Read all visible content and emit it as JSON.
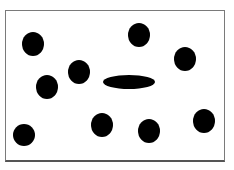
{
  "figure": {
    "frame": {
      "x": 5,
      "y": 10,
      "width": 219,
      "height": 151,
      "border_color": "#7a7a7a"
    },
    "fill_color": "#000000",
    "circles": [
      {
        "cx": 33,
        "cy": 44,
        "rx": 11,
        "ry": 12
      },
      {
        "cx": 139,
        "cy": 35,
        "rx": 11,
        "ry": 12
      },
      {
        "cx": 185,
        "cy": 59,
        "rx": 11,
        "ry": 12
      },
      {
        "cx": 79,
        "cy": 72,
        "rx": 11,
        "ry": 12
      },
      {
        "cx": 47,
        "cy": 87,
        "rx": 11,
        "ry": 12
      },
      {
        "cx": 24,
        "cy": 135,
        "rx": 11,
        "ry": 11
      },
      {
        "cx": 102,
        "cy": 125,
        "rx": 11,
        "ry": 12
      },
      {
        "cx": 149,
        "cy": 131,
        "rx": 11,
        "ry": 12
      },
      {
        "cx": 204,
        "cy": 121,
        "rx": 11,
        "ry": 12
      }
    ],
    "ellipse": {
      "cx": 129,
      "cy": 82,
      "rx": 26,
      "ry": 7
    }
  }
}
